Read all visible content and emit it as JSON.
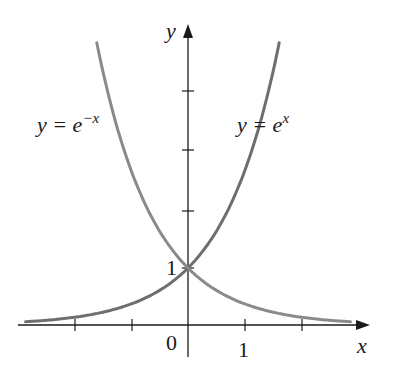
{
  "chart_data": {
    "type": "line",
    "title": "",
    "xlabel": "x",
    "ylabel": "y",
    "origin_label": "0",
    "x_tick_label": "1",
    "y_tick_label": "1",
    "xlim": [
      -2.9,
      3.1
    ],
    "ylim": [
      -0.3,
      5.3
    ],
    "x_ticks": [
      -2,
      -1,
      0,
      1,
      2
    ],
    "y_ticks": [
      1,
      2,
      3,
      4
    ],
    "grid": false,
    "legend": "inline labels",
    "series": [
      {
        "name": "y = e^x",
        "label_base": "y = e",
        "label_exp": "x",
        "color": "#6e6e6e",
        "x_range": [
          -2.85,
          1.6
        ],
        "function": "exp(x)"
      },
      {
        "name": "y = e^-x",
        "label_base": "y = e",
        "label_exp": "−x",
        "color": "#8a8a8a",
        "x_range": [
          -1.6,
          2.85
        ],
        "function": "exp(-x)"
      }
    ],
    "annotations": [
      {
        "text": "y = e^-x",
        "position": "upper left"
      },
      {
        "text": "y = e^x",
        "position": "upper right"
      }
    ]
  },
  "colors": {
    "axis": "#1a1a1a",
    "curve_exp": "#6e6e6e",
    "curve_exp_neg": "#8a8a8a"
  }
}
